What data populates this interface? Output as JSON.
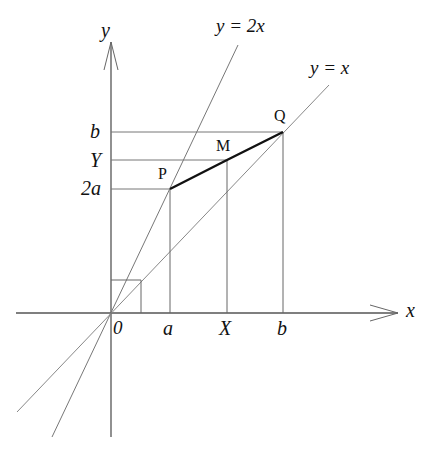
{
  "figure": {
    "type": "coordinate-geometry-diagram",
    "axes": {
      "x_label": "x",
      "y_label": "y",
      "origin_label": "0"
    },
    "x_ticks": [
      {
        "label": "a",
        "px": 170
      },
      {
        "label": "X",
        "px": 227
      },
      {
        "label": "b",
        "px": 283
      }
    ],
    "y_ticks": [
      {
        "label": "b",
        "py": 132
      },
      {
        "label": "Y",
        "py": 160
      },
      {
        "label": "2a",
        "py": 189
      }
    ],
    "lines": [
      {
        "label": "y = 2x",
        "name": "line-y-eq-2x"
      },
      {
        "label": "y = x",
        "name": "line-y-eq-x"
      }
    ],
    "points": [
      {
        "label": "P",
        "px": 170,
        "py": 189
      },
      {
        "label": "M",
        "px": 227,
        "py": 160
      },
      {
        "label": "Q",
        "px": 283,
        "py": 132
      }
    ],
    "segment": {
      "from": "P",
      "to": "Q",
      "through": "M"
    },
    "colors": {
      "axis": "#555555",
      "line": "#777777",
      "segment": "#111111",
      "text": "#111111"
    }
  }
}
